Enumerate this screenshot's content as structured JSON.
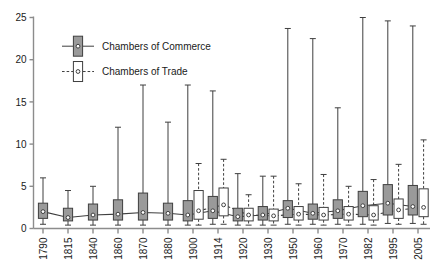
{
  "chart_data": {
    "type": "box",
    "title": "",
    "xlabel": "",
    "ylabel": "",
    "ylim": [
      0,
      25
    ],
    "yticks": [
      0,
      5,
      10,
      15,
      20,
      25
    ],
    "grid": false,
    "legend_position": "top-left",
    "categories": [
      "1790",
      "1815",
      "1840",
      "1860",
      "1870",
      "1880",
      "1900",
      "1914",
      "1920",
      "1930",
      "1950",
      "1960",
      "1970",
      "1982",
      "1995",
      "2005"
    ],
    "legend": [
      {
        "name": "Chambers of Commerce",
        "fill": "#9a9a9a",
        "line": "#3a3a3a",
        "dash": "solid"
      },
      {
        "name": "Chambers of Trade",
        "fill": "#ffffff",
        "line": "#3a3a3a",
        "dash": "dashed"
      }
    ],
    "series": [
      {
        "name": "Chambers of Commerce",
        "boxes": [
          {
            "x": "1790",
            "min": 0.5,
            "q1": 1.2,
            "median": 2.0,
            "q3": 3.0,
            "max": 6.0
          },
          {
            "x": "1815",
            "min": 0.4,
            "q1": 0.9,
            "median": 1.3,
            "q3": 2.4,
            "max": 4.5
          },
          {
            "x": "1840",
            "min": 0.4,
            "q1": 1.0,
            "median": 1.6,
            "q3": 2.9,
            "max": 5.0
          },
          {
            "x": "1860",
            "min": 0.4,
            "q1": 1.0,
            "median": 1.7,
            "q3": 3.4,
            "max": 12.0
          },
          {
            "x": "1870",
            "min": 0.4,
            "q1": 1.0,
            "median": 1.9,
            "q3": 4.2,
            "max": 17.0
          },
          {
            "x": "1880",
            "min": 0.4,
            "q1": 1.0,
            "median": 1.8,
            "q3": 3.0,
            "max": 12.6
          },
          {
            "x": "1900",
            "min": 0.4,
            "q1": 0.9,
            "median": 1.6,
            "q3": 3.3,
            "max": 17.0
          },
          {
            "x": "1914",
            "min": 0.5,
            "q1": 1.2,
            "median": 2.1,
            "q3": 3.8,
            "max": 16.3
          },
          {
            "x": "1920",
            "min": 0.4,
            "q1": 0.9,
            "median": 1.4,
            "q3": 2.4,
            "max": 6.5
          },
          {
            "x": "1930",
            "min": 0.4,
            "q1": 1.0,
            "median": 1.6,
            "q3": 2.6,
            "max": 6.2
          },
          {
            "x": "1950",
            "min": 0.5,
            "q1": 1.3,
            "median": 2.4,
            "q3": 3.3,
            "max": 23.7
          },
          {
            "x": "1960",
            "min": 0.5,
            "q1": 1.1,
            "median": 1.8,
            "q3": 2.9,
            "max": 22.5
          },
          {
            "x": "1970",
            "min": 0.5,
            "q1": 1.2,
            "median": 2.1,
            "q3": 3.4,
            "max": 14.3
          },
          {
            "x": "1982",
            "min": 0.5,
            "q1": 1.4,
            "median": 2.7,
            "q3": 4.4,
            "max": 25.0
          },
          {
            "x": "1995",
            "min": 0.6,
            "q1": 1.6,
            "median": 3.0,
            "q3": 5.2,
            "max": 24.6
          },
          {
            "x": "2005",
            "min": 0.6,
            "q1": 1.6,
            "median": 2.6,
            "q3": 5.1,
            "max": 24.0
          }
        ]
      },
      {
        "name": "Chambers of Trade",
        "boxes": [
          {
            "x": "1900",
            "min": 0.4,
            "q1": 1.1,
            "median": 2.1,
            "q3": 4.5,
            "max": 7.7
          },
          {
            "x": "1914",
            "min": 0.5,
            "q1": 1.5,
            "median": 2.8,
            "q3": 4.8,
            "max": 8.2
          },
          {
            "x": "1920",
            "min": 0.4,
            "q1": 0.9,
            "median": 1.6,
            "q3": 2.4,
            "max": 4.0
          },
          {
            "x": "1930",
            "min": 0.4,
            "q1": 0.9,
            "median": 1.5,
            "q3": 2.3,
            "max": 6.2
          },
          {
            "x": "1950",
            "min": 0.4,
            "q1": 1.0,
            "median": 1.7,
            "q3": 2.6,
            "max": 5.3
          },
          {
            "x": "1960",
            "min": 0.4,
            "q1": 1.0,
            "median": 1.6,
            "q3": 2.5,
            "max": 6.4
          },
          {
            "x": "1970",
            "min": 0.4,
            "q1": 1.0,
            "median": 1.7,
            "q3": 2.6,
            "max": 5.0
          },
          {
            "x": "1982",
            "min": 0.4,
            "q1": 1.0,
            "median": 1.6,
            "q3": 2.7,
            "max": 5.8
          },
          {
            "x": "1995",
            "min": 0.5,
            "q1": 1.2,
            "median": 2.2,
            "q3": 3.5,
            "max": 7.6
          },
          {
            "x": "2005",
            "min": 0.5,
            "q1": 1.4,
            "median": 2.5,
            "q3": 4.7,
            "max": 10.5
          }
        ]
      }
    ]
  }
}
